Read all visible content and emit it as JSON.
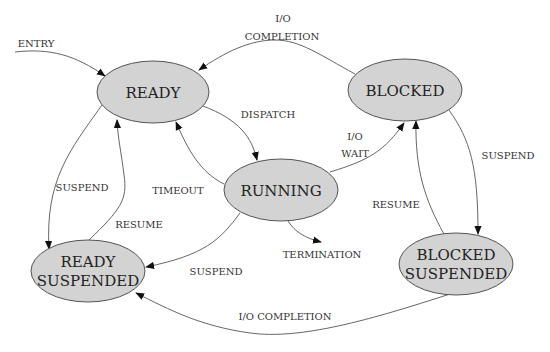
{
  "diagram": {
    "type": "state-transition",
    "nodes": {
      "ready": {
        "lines": [
          "READY"
        ]
      },
      "blocked": {
        "lines": [
          "BLOCKED"
        ]
      },
      "running": {
        "lines": [
          "RUNNING"
        ]
      },
      "ready_suspended": {
        "lines": [
          "READY",
          "SUSPENDED"
        ]
      },
      "blocked_suspended": {
        "lines": [
          "BLOCKED",
          "SUSPENDED"
        ]
      }
    },
    "edges": {
      "entry": {
        "from": "",
        "to": "ready",
        "label": [
          "ENTRY"
        ]
      },
      "io_completion_top": {
        "from": "blocked",
        "to": "ready",
        "label": [
          "I/O",
          "COMPLETION"
        ]
      },
      "dispatch": {
        "from": "ready",
        "to": "running",
        "label": [
          "DISPATCH"
        ]
      },
      "timeout": {
        "from": "running",
        "to": "ready",
        "label": [
          "TIMEOUT"
        ]
      },
      "io_wait": {
        "from": "running",
        "to": "blocked",
        "label": [
          "I/O",
          "WAIT"
        ]
      },
      "termination": {
        "from": "running",
        "to": "",
        "label": [
          "TERMINATION"
        ]
      },
      "suspend_ready": {
        "from": "ready",
        "to": "ready_suspended",
        "label": [
          "SUSPEND"
        ]
      },
      "resume_ready": {
        "from": "ready_suspended",
        "to": "ready",
        "label": [
          "RESUME"
        ]
      },
      "suspend_running": {
        "from": "running",
        "to": "ready_suspended",
        "label": [
          "SUSPEND"
        ]
      },
      "suspend_blocked": {
        "from": "blocked",
        "to": "blocked_suspended",
        "label": [
          "SUSPEND"
        ]
      },
      "resume_blocked": {
        "from": "blocked_suspended",
        "to": "blocked",
        "label": [
          "RESUME"
        ]
      },
      "io_completion_bottom": {
        "from": "blocked_suspended",
        "to": "ready_suspended",
        "label": [
          "I/O COMPLETION"
        ]
      }
    },
    "colors": {
      "node_fill": "#d3d3d3",
      "node_stroke": "#555555",
      "edge": "#555555",
      "text": "#222222"
    }
  }
}
